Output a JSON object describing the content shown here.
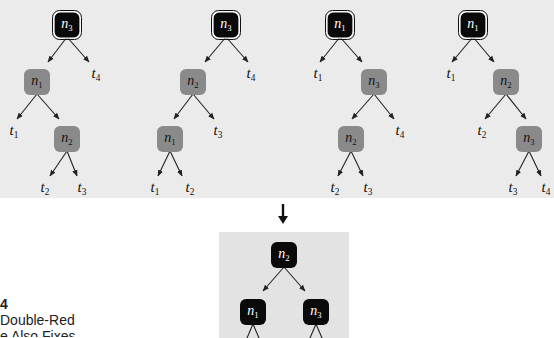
{
  "colors": {
    "top_panel_bg": "#ebebeb",
    "bottom_panel_bg": "#e3e3e3",
    "black_node": "#0a0a0a",
    "red_node": "#8a8a8a",
    "node_text_black": "#ffffff",
    "node_text_red": "#111111",
    "edge": "#222222"
  },
  "caption": {
    "figure_number": "4",
    "line1": "Double-Red",
    "line2": "e Also Fixes"
  },
  "trees": [
    {
      "id": "tree-1",
      "nodes": [
        {
          "id": "a",
          "label": "n",
          "sub": "3",
          "x": 67,
          "y": 25,
          "color": "black",
          "root": true
        },
        {
          "id": "b",
          "label": "n",
          "sub": "1",
          "x": 37,
          "y": 82,
          "color": "red"
        },
        {
          "id": "c",
          "label": "n",
          "sub": "2",
          "x": 67,
          "y": 139,
          "color": "red"
        }
      ],
      "leaves": [
        {
          "label": "t",
          "sub": "4",
          "x": 96,
          "y": 78
        },
        {
          "label": "t",
          "sub": "1",
          "x": 14,
          "y": 135
        },
        {
          "label": "t",
          "sub": "2",
          "x": 45,
          "y": 192
        },
        {
          "label": "t",
          "sub": "3",
          "x": 82,
          "y": 192
        }
      ],
      "edges": [
        [
          67,
          25,
          48,
          62
        ],
        [
          67,
          25,
          89,
          62
        ],
        [
          37,
          82,
          17,
          119
        ],
        [
          37,
          82,
          59,
          119
        ],
        [
          67,
          139,
          50,
          176
        ],
        [
          67,
          139,
          77,
          176
        ]
      ]
    },
    {
      "id": "tree-2",
      "nodes": [
        {
          "id": "a",
          "label": "n",
          "sub": "3",
          "x": 226,
          "y": 25,
          "color": "black",
          "root": true
        },
        {
          "id": "b",
          "label": "n",
          "sub": "2",
          "x": 193,
          "y": 82,
          "color": "red"
        },
        {
          "id": "c",
          "label": "n",
          "sub": "1",
          "x": 170,
          "y": 139,
          "color": "red"
        }
      ],
      "leaves": [
        {
          "label": "t",
          "sub": "4",
          "x": 251,
          "y": 78
        },
        {
          "label": "t",
          "sub": "3",
          "x": 218,
          "y": 135
        },
        {
          "label": "t",
          "sub": "1",
          "x": 155,
          "y": 192
        },
        {
          "label": "t",
          "sub": "2",
          "x": 190,
          "y": 192
        }
      ],
      "edges": [
        [
          226,
          25,
          205,
          62
        ],
        [
          226,
          25,
          248,
          62
        ],
        [
          193,
          82,
          174,
          119
        ],
        [
          193,
          82,
          214,
          119
        ],
        [
          170,
          139,
          158,
          176
        ],
        [
          170,
          139,
          182,
          176
        ]
      ]
    },
    {
      "id": "tree-3",
      "nodes": [
        {
          "id": "a",
          "label": "n",
          "sub": "1",
          "x": 340,
          "y": 25,
          "color": "black",
          "root": true
        },
        {
          "id": "b",
          "label": "n",
          "sub": "3",
          "x": 374,
          "y": 82,
          "color": "red"
        },
        {
          "id": "c",
          "label": "n",
          "sub": "2",
          "x": 351,
          "y": 139,
          "color": "red"
        }
      ],
      "leaves": [
        {
          "label": "t",
          "sub": "1",
          "x": 318,
          "y": 78
        },
        {
          "label": "t",
          "sub": "4",
          "x": 400,
          "y": 135
        },
        {
          "label": "t",
          "sub": "2",
          "x": 335,
          "y": 192
        },
        {
          "label": "t",
          "sub": "3",
          "x": 368,
          "y": 192
        }
      ],
      "edges": [
        [
          340,
          25,
          320,
          62
        ],
        [
          340,
          25,
          362,
          62
        ],
        [
          374,
          82,
          352,
          119
        ],
        [
          374,
          82,
          394,
          119
        ],
        [
          351,
          139,
          338,
          176
        ],
        [
          351,
          139,
          363,
          176
        ]
      ]
    },
    {
      "id": "tree-4",
      "nodes": [
        {
          "id": "a",
          "label": "n",
          "sub": "1",
          "x": 473,
          "y": 25,
          "color": "black",
          "root": true
        },
        {
          "id": "b",
          "label": "n",
          "sub": "2",
          "x": 506,
          "y": 82,
          "color": "red"
        },
        {
          "id": "c",
          "label": "n",
          "sub": "3",
          "x": 529,
          "y": 139,
          "color": "red"
        }
      ],
      "leaves": [
        {
          "label": "t",
          "sub": "1",
          "x": 451,
          "y": 78
        },
        {
          "label": "t",
          "sub": "2",
          "x": 482,
          "y": 135
        },
        {
          "label": "t",
          "sub": "3",
          "x": 513,
          "y": 192
        },
        {
          "label": "t",
          "sub": "4",
          "x": 546,
          "y": 192
        }
      ],
      "edges": [
        [
          473,
          25,
          452,
          62
        ],
        [
          473,
          25,
          494,
          62
        ],
        [
          506,
          82,
          485,
          119
        ],
        [
          506,
          82,
          526,
          119
        ],
        [
          529,
          139,
          516,
          176
        ],
        [
          529,
          139,
          541,
          176
        ]
      ]
    },
    {
      "id": "tree-result",
      "nodes": [
        {
          "id": "a",
          "label": "n",
          "sub": "2",
          "x": 284,
          "y": 255,
          "color": "black"
        },
        {
          "id": "b",
          "label": "n",
          "sub": "1",
          "x": 253,
          "y": 312,
          "color": "black"
        },
        {
          "id": "c",
          "label": "n",
          "sub": "3",
          "x": 316,
          "y": 312,
          "color": "black"
        }
      ],
      "leaves": [],
      "edges": [
        [
          284,
          255,
          263,
          291
        ],
        [
          284,
          255,
          305,
          291
        ],
        [
          253,
          312,
          244,
          345
        ],
        [
          253,
          312,
          262,
          345
        ],
        [
          316,
          312,
          307,
          345
        ],
        [
          316,
          312,
          325,
          345
        ]
      ]
    }
  ],
  "transition_arrow": {
    "x": 283,
    "y1": 204,
    "y2": 224
  }
}
